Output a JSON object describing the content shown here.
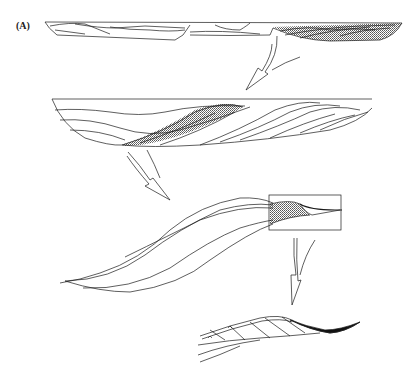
{
  "figure": {
    "panel_label": "(A)",
    "stages": [
      {
        "id": "stage-1",
        "description": "Elongate cross-section with cross-cutting lenticular units; right portion shaded"
      },
      {
        "id": "stage-2",
        "description": "Enlarged cross-section of imbricated inclined lenses; central lens shaded"
      },
      {
        "id": "stage-3",
        "description": "Single sigmoidal lens set with boxed inset at right showing shaded wedge"
      },
      {
        "id": "stage-4",
        "description": "Detail of boxed inset: inclined beds with small symbols, thinning to black wedge at right"
      }
    ],
    "colors": {
      "line": "#1a1a1a",
      "shade": "#9a9a9a",
      "fill_dark": "#111111",
      "background": "#ffffff"
    }
  }
}
